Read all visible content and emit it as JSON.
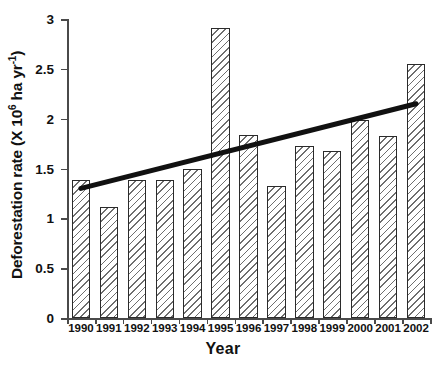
{
  "chart_data": {
    "type": "bar",
    "title": "",
    "xlabel": "Year",
    "ylabel": "Deforestation rate (X 10^6 ha yr^-1)",
    "ylabel_main": "Deforestation rate (X 10",
    "ylabel_sup1": "6",
    "ylabel_mid": " ha yr",
    "ylabel_sup2": "-1",
    "ylabel_end": ")",
    "categories": [
      "1990",
      "1991",
      "1992",
      "1993",
      "1994",
      "1995",
      "1996",
      "1997",
      "1998",
      "1999",
      "2000",
      "2001",
      "2002"
    ],
    "values": [
      1.38,
      1.11,
      1.38,
      1.38,
      1.5,
      2.91,
      1.84,
      1.32,
      1.73,
      1.68,
      1.99,
      1.83,
      2.55
    ],
    "ylim": [
      0,
      3
    ],
    "ytick_values": [
      0,
      0.5,
      1,
      1.5,
      2,
      2.5,
      3
    ],
    "ytick_labels": [
      "0",
      "0.5",
      "1",
      "1.5",
      "2",
      "2.5",
      "3"
    ],
    "grid": false,
    "legend": "none",
    "series": [
      {
        "name": "Deforestation rate",
        "type": "bar",
        "values": [
          1.38,
          1.11,
          1.38,
          1.38,
          1.5,
          2.91,
          1.84,
          1.32,
          1.73,
          1.68,
          1.99,
          1.83,
          2.55
        ]
      },
      {
        "name": "Linear trend",
        "type": "line",
        "x": [
          "1990",
          "2002"
        ],
        "values": [
          1.3,
          2.15
        ],
        "color": "#111111"
      }
    ],
    "bar_style": {
      "fill": "diagonal-hatch",
      "edge_color": "#2b2b2b",
      "hatch_color": "#6e6e6e",
      "background": "#ffffff"
    },
    "axis_color": "#4a4a4a"
  }
}
